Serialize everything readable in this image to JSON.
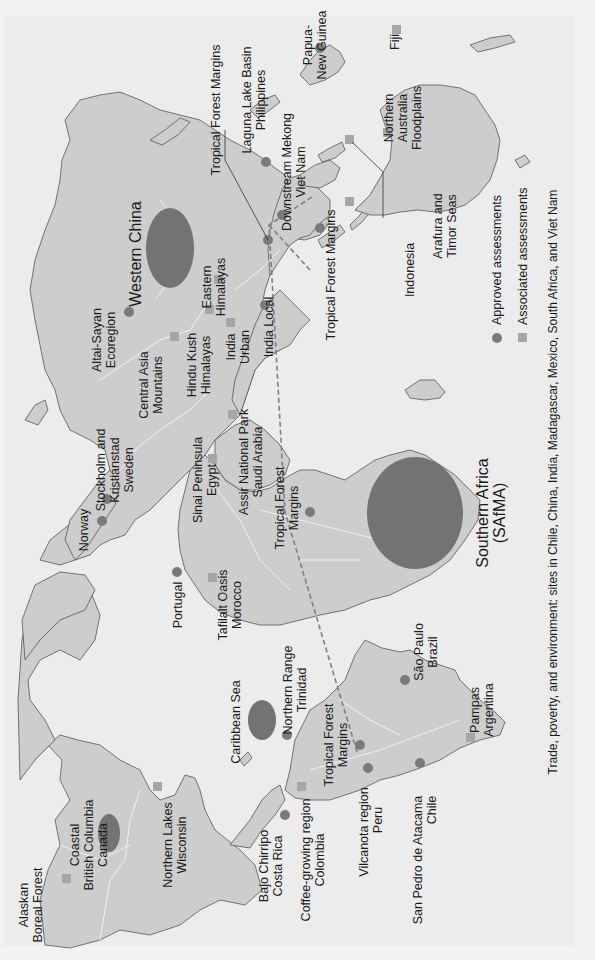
{
  "map": {
    "orientation": "rotated -90 degrees (text reads bottom-to-top)",
    "caption": "Trade, poverty, and environment: sites in Chile, China, India, Madagascar, Mexico, South Africa, and Viet Nam",
    "legend": {
      "approved": {
        "label": "Approved assessments",
        "symbol": "circle",
        "color": "#7a7a7a"
      },
      "associated": {
        "label": "Associated assessments",
        "symbol": "square",
        "color": "#a6a6a6"
      }
    },
    "colors": {
      "ocean": "#ececec",
      "land": "#cdcdcd",
      "approved": "#7a7a7a",
      "associated": "#a6a6a6",
      "large_area": "#737373"
    },
    "sites": {
      "alaskan": {
        "l1": "Alaskan",
        "l2": "Boreal Forest",
        "type": "associated"
      },
      "coastal_bc": {
        "l1": "Coastal",
        "l2": "British Columbia",
        "l3": "Canada",
        "type": "approved-area"
      },
      "northern_lakes": {
        "l1": "Northern Lakes",
        "l2": "Wisconsin",
        "type": "associated"
      },
      "bajo_chirripo": {
        "l1": "Bajo Chirripo",
        "l2": "Costa Rica",
        "type": "approved"
      },
      "coffee": {
        "l1": "Coffee-growing region",
        "l2": "Colombia",
        "type": "associated"
      },
      "vilcanota": {
        "l1": "Vilcanota region",
        "l2": "Peru",
        "type": "approved"
      },
      "san_pedro": {
        "l1": "San Pedro de Atacama",
        "l2": "Chile",
        "type": "approved"
      },
      "caribbean": {
        "l1": "Caribbean Sea",
        "type": "approved-area"
      },
      "northern_range": {
        "l1": "Northern Range",
        "l2": "Trinidad",
        "type": "approved"
      },
      "tfm_sa": {
        "l1": "Tropical Forest",
        "l2": "Margins",
        "type": "approved"
      },
      "sao_paulo": {
        "l1": "São Paulo",
        "l2": "Brazil",
        "type": "approved"
      },
      "pampas": {
        "l1": "Pampas",
        "l2": "Argentina",
        "type": "associated"
      },
      "portugal": {
        "l1": "Portugal",
        "type": "approved"
      },
      "tafilalt": {
        "l1": "Tafilalt Oasis",
        "l2": "Morocco",
        "type": "associated"
      },
      "norway": {
        "l1": "Norway",
        "type": "approved"
      },
      "stockholm": {
        "l1": "Stockholm and",
        "l2": "Kristianstad",
        "l3": "Sweden",
        "type": "approved"
      },
      "sinai": {
        "l1": "Sinai Peninsula",
        "l2": "Egypt",
        "type": "associated"
      },
      "assir": {
        "l1": "Assir National Park",
        "l2": "Saudi Arabia",
        "type": "associated"
      },
      "tfm_africa": {
        "l1": "Tropical Forest",
        "l2": "Margins",
        "type": "approved"
      },
      "safma": {
        "l1": "Southern Africa",
        "l2": "(SAfMA)",
        "type": "approved-area"
      },
      "altai": {
        "l1": "Altai-Sayan",
        "l2": "Ecoregion",
        "type": "approved"
      },
      "western_china": {
        "l1": "Western China",
        "type": "approved-area"
      },
      "central_asia": {
        "l1": "Central Asia",
        "l2": "Mountains",
        "type": "associated"
      },
      "hindu_kush": {
        "l1": "Hindu Kush",
        "l2": "Himalayas",
        "type": "associated"
      },
      "eastern_him": {
        "l1": "Eastern",
        "l2": "Himalayas",
        "type": "associated"
      },
      "india_urban": {
        "l1": "India",
        "l2": "Urban",
        "type": "associated"
      },
      "india_local": {
        "l1": "India Local",
        "type": "approved"
      },
      "tfm_asia": {
        "l1": "Tropical Forest Margins",
        "type": "approved"
      },
      "laguna": {
        "l1": "Laguna Lake Basin",
        "l2": "Philippines",
        "type": "approved"
      },
      "mekong": {
        "l1": "Downstream Mekong",
        "l2": "Viet Nam",
        "type": "approved"
      },
      "tfm_indonesia": {
        "l1": "Tropical Forest Margins",
        "type": "approved"
      },
      "indonesia": {
        "l1": "Indonesia",
        "type": "associated"
      },
      "arafura": {
        "l1": "Arafura and",
        "l2": "Timor Seas",
        "type": "associated"
      },
      "n_australia": {
        "l1": "Northern",
        "l2": "Australia",
        "l3": "Floodplains",
        "type": "associated"
      },
      "png": {
        "l1": "Papua-",
        "l2": "New Guinea",
        "type": "approved"
      },
      "fiji": {
        "l1": "Fiji",
        "type": "associated"
      }
    }
  }
}
